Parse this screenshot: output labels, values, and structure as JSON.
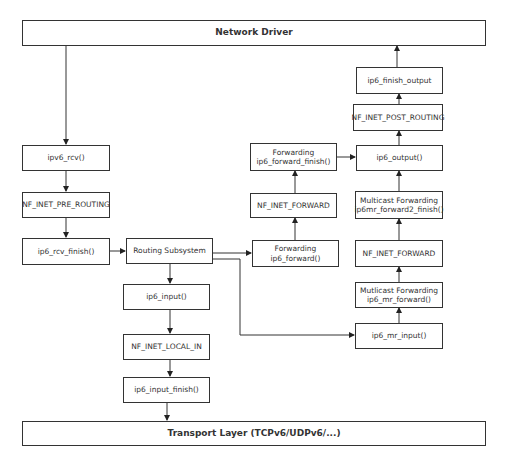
{
  "diagram": {
    "top_layer": "Network Driver",
    "bottom_layer": "Transport Layer (TCPv6/UDPv6/...)",
    "receive_path": {
      "rcv": "ipv6_rcv()",
      "pre_routing": "NF_INET_PRE_ROUTING",
      "rcv_finish": "ip6_rcv_finish()",
      "routing": "Routing Subsystem"
    },
    "local_delivery": {
      "input": "ip6_input()",
      "local_in": "NF_INET_LOCAL_IN",
      "input_finish": "ip6_input_finish()"
    },
    "forwarding": {
      "forward_title": "Forwarding",
      "forward_fn": "ip6_forward()",
      "nf_forward": "NF_INET_FORWARD",
      "forward_finish_title": "Forwarding",
      "forward_finish_fn": "ip6_forward_finish()"
    },
    "multicast": {
      "mr_input": "ip6_mr_input()",
      "mr_forward_title": "Mutlicast Forwarding",
      "mr_forward_fn": "ip6_mr_forward()",
      "nf_forward": "NF_INET_FORWARD",
      "mr_forward2_title": "Multicast Forwarding",
      "mr_forward2_fn": "ip6mr_forward2_finish()"
    },
    "output_path": {
      "output": "ip6_output()",
      "post_routing": "NF_INET_POST_ROUTING",
      "finish_output": "ip6_finish_output"
    }
  }
}
